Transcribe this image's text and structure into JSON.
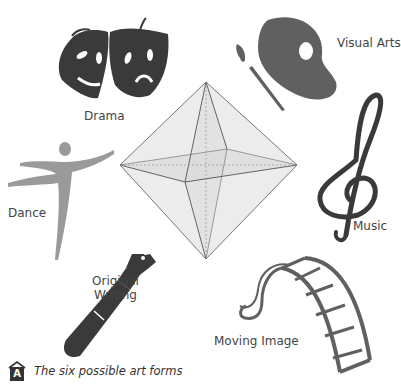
{
  "figure": {
    "center_shape": "octahedron",
    "colors": {
      "icon_dark": "#3a3a3a",
      "icon_mid": "#606060",
      "icon_light": "#9a9a9a",
      "octahedron_fill": "#e8e8e8",
      "octahedron_stroke": "#555555",
      "label_text": "#444444"
    },
    "art_forms": [
      {
        "label": "Drama",
        "icon": "theatre-masks-icon"
      },
      {
        "label": "Visual Arts",
        "icon": "palette-brush-icon"
      },
      {
        "label": "Music",
        "icon": "treble-clef-icon"
      },
      {
        "label": "Dance",
        "icon": "dancer-icon"
      },
      {
        "label": "Original Writing",
        "label_lines": [
          "Original",
          "Writing"
        ],
        "icon": "fountain-pen-icon"
      },
      {
        "label": "Moving Image",
        "icon": "film-strip-icon"
      }
    ]
  },
  "caption": {
    "badge": "A",
    "text": "The six possible art forms"
  }
}
